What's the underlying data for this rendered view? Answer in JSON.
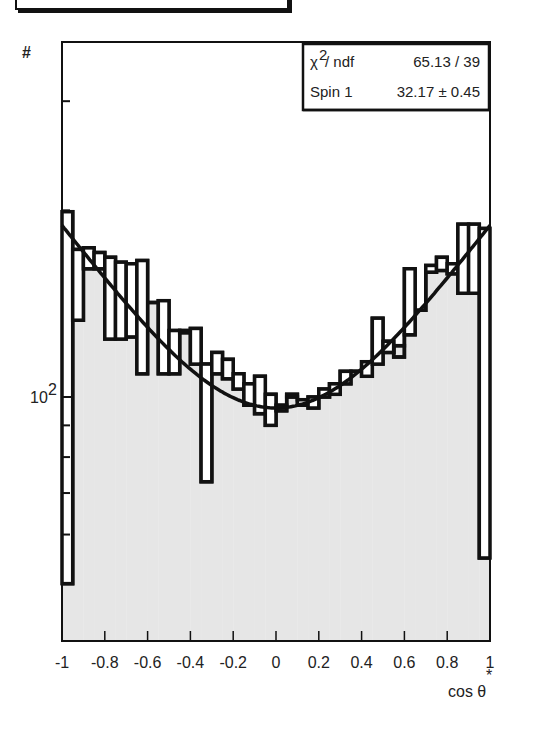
{
  "chart_data": {
    "type": "bar",
    "title": "",
    "xlabel": "cos θ*",
    "xlabel_main": "cos θ",
    "xlabel_sup": "*",
    "ylabel": "#",
    "yscale": "log",
    "xlim": [
      -1,
      1
    ],
    "ylim": [
      40,
      374
    ],
    "bin_width": 0.05,
    "x_ticks": [
      "-1",
      "-0.8",
      "-0.6",
      "-0.4",
      "-0.2",
      "0",
      "0.2",
      "0.4",
      "0.6",
      "0.8",
      "1"
    ],
    "x_tick_values": [
      -1,
      -0.8,
      -0.6,
      -0.4,
      -0.2,
      0,
      0.2,
      0.4,
      0.6,
      0.8,
      1
    ],
    "y_major_ticks": [
      {
        "value": 100,
        "label_base": "10",
        "label_exp": "2"
      }
    ],
    "y_minor_ticks": [
      60,
      70,
      80,
      90,
      200,
      300
    ],
    "series": [
      {
        "name": "outline-histogram",
        "style": "step-outline",
        "values": [
          199,
          173,
          174,
          171,
          168,
          165,
          164,
          166,
          142,
          143,
          128,
          127,
          129,
          113,
          118,
          115,
          109,
          105,
          108,
          101,
          97,
          100,
          99,
          100,
          103,
          105,
          110,
          110,
          114,
          134,
          123,
          116,
          161,
          138,
          163,
          168,
          164,
          190,
          190,
          187
        ]
      },
      {
        "name": "filled-histogram",
        "style": "gray-filled",
        "values": [
          50,
          133,
          161,
          161,
          124,
          124,
          125,
          109,
          142,
          109,
          109,
          128,
          113,
          73,
          109,
          107,
          103,
          97,
          94,
          90,
          95,
          101,
          97,
          96,
          100,
          101,
          105,
          110,
          108,
          113,
          118,
          121,
          126,
          138,
          159,
          160,
          158,
          147,
          147,
          55
        ]
      }
    ],
    "fit": {
      "name": "Spin 1 fit",
      "form": "a*(1+b*x^2)",
      "a": 96,
      "b": 0.97
    },
    "stats_box": {
      "rows": [
        {
          "label_base": "χ",
          "label_exp": "2",
          "label_rest": " / ndf",
          "value": "65.13 / 39"
        },
        {
          "label_base": "Spin 1",
          "label_exp": "",
          "label_rest": "",
          "value": "32.17 ± 0.45"
        }
      ]
    },
    "legend": "top-right",
    "grid": false
  },
  "colors": {
    "fill": "#e6e6e6",
    "line": "#111111",
    "text": "#222222"
  }
}
